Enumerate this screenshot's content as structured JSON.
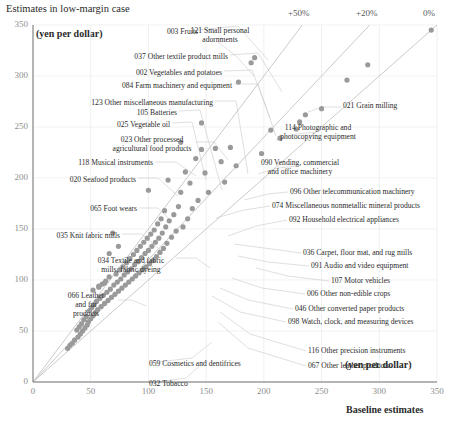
{
  "chart_data": {
    "type": "scatter",
    "title": "Estimates in low-margin case",
    "xlabel": "Baseline estimates",
    "ylabel": "",
    "x_unit": "(yen per dollar)",
    "y_unit": "(yen per dollar)",
    "xlim": [
      0,
      350
    ],
    "ylim": [
      0,
      350
    ],
    "xticks": [
      0,
      50,
      100,
      150,
      200,
      250,
      300,
      350
    ],
    "yticks": [
      0,
      50,
      100,
      150,
      200,
      250,
      300,
      350
    ],
    "grid": true,
    "legend": "none",
    "point_color": "#9a9a9a",
    "reference_lines": [
      {
        "label": "0%",
        "slope": 1.0,
        "x_at_top": 350
      },
      {
        "label": "+20%",
        "slope": 1.2,
        "x_at_top": 292
      },
      {
        "label": "+50%",
        "slope": 1.5,
        "x_at_top": 233
      }
    ],
    "points": [
      {
        "x": 345,
        "y": 345
      },
      {
        "x": 290,
        "y": 311
      },
      {
        "x": 272,
        "y": 296
      },
      {
        "x": 250,
        "y": 268
      },
      {
        "x": 236,
        "y": 262
      },
      {
        "x": 231,
        "y": 255
      },
      {
        "x": 228,
        "y": 248
      },
      {
        "x": 214,
        "y": 239
      },
      {
        "x": 206,
        "y": 247
      },
      {
        "x": 198,
        "y": 224
      },
      {
        "x": 192,
        "y": 318
      },
      {
        "x": 189,
        "y": 313
      },
      {
        "x": 178,
        "y": 294
      },
      {
        "x": 176,
        "y": 212
      },
      {
        "x": 171,
        "y": 230
      },
      {
        "x": 166,
        "y": 196
      },
      {
        "x": 163,
        "y": 216
      },
      {
        "x": 158,
        "y": 229
      },
      {
        "x": 152,
        "y": 186
      },
      {
        "x": 149,
        "y": 205
      },
      {
        "x": 146,
        "y": 228
      },
      {
        "x": 143,
        "y": 178
      },
      {
        "x": 141,
        "y": 219
      },
      {
        "x": 138,
        "y": 170
      },
      {
        "x": 136,
        "y": 195
      },
      {
        "x": 134,
        "y": 160
      },
      {
        "x": 132,
        "y": 206
      },
      {
        "x": 130,
        "y": 152
      },
      {
        "x": 128,
        "y": 186
      },
      {
        "x": 126,
        "y": 172
      },
      {
        "x": 124,
        "y": 148
      },
      {
        "x": 122,
        "y": 164
      },
      {
        "x": 120,
        "y": 142
      },
      {
        "x": 118,
        "y": 158
      },
      {
        "x": 117,
        "y": 198
      },
      {
        "x": 116,
        "y": 136
      },
      {
        "x": 115,
        "y": 152
      },
      {
        "x": 114,
        "y": 168
      },
      {
        "x": 113,
        "y": 131
      },
      {
        "x": 112,
        "y": 146
      },
      {
        "x": 111,
        "y": 160
      },
      {
        "x": 110,
        "y": 127
      },
      {
        "x": 109,
        "y": 141
      },
      {
        "x": 108,
        "y": 155
      },
      {
        "x": 107,
        "y": 123
      },
      {
        "x": 106,
        "y": 137
      },
      {
        "x": 105,
        "y": 149
      },
      {
        "x": 104,
        "y": 119
      },
      {
        "x": 103,
        "y": 133
      },
      {
        "x": 102,
        "y": 145
      },
      {
        "x": 101,
        "y": 116
      },
      {
        "x": 100,
        "y": 129
      },
      {
        "x": 99,
        "y": 141
      },
      {
        "x": 98,
        "y": 113
      },
      {
        "x": 97,
        "y": 126
      },
      {
        "x": 96,
        "y": 137
      },
      {
        "x": 95,
        "y": 110
      },
      {
        "x": 94,
        "y": 122
      },
      {
        "x": 93,
        "y": 133
      },
      {
        "x": 92,
        "y": 107
      },
      {
        "x": 91,
        "y": 118
      },
      {
        "x": 90,
        "y": 129
      },
      {
        "x": 89,
        "y": 104
      },
      {
        "x": 88,
        "y": 115
      },
      {
        "x": 87,
        "y": 125
      },
      {
        "x": 86,
        "y": 101
      },
      {
        "x": 85,
        "y": 111
      },
      {
        "x": 84,
        "y": 121
      },
      {
        "x": 83,
        "y": 98
      },
      {
        "x": 82,
        "y": 108
      },
      {
        "x": 81,
        "y": 117
      },
      {
        "x": 80,
        "y": 95
      },
      {
        "x": 79,
        "y": 105
      },
      {
        "x": 78,
        "y": 113
      },
      {
        "x": 77,
        "y": 92
      },
      {
        "x": 76,
        "y": 101
      },
      {
        "x": 75,
        "y": 110
      },
      {
        "x": 74,
        "y": 89
      },
      {
        "x": 73,
        "y": 98
      },
      {
        "x": 72,
        "y": 106
      },
      {
        "x": 71,
        "y": 86
      },
      {
        "x": 70,
        "y": 95
      },
      {
        "x": 69,
        "y": 146
      },
      {
        "x": 68,
        "y": 83
      },
      {
        "x": 67,
        "y": 91
      },
      {
        "x": 66,
        "y": 103
      },
      {
        "x": 65,
        "y": 80
      },
      {
        "x": 64,
        "y": 88
      },
      {
        "x": 63,
        "y": 99
      },
      {
        "x": 62,
        "y": 77
      },
      {
        "x": 61,
        "y": 85
      },
      {
        "x": 60,
        "y": 96
      },
      {
        "x": 59,
        "y": 74
      },
      {
        "x": 58,
        "y": 82
      },
      {
        "x": 57,
        "y": 93
      },
      {
        "x": 56,
        "y": 71
      },
      {
        "x": 55,
        "y": 79
      },
      {
        "x": 54,
        "y": 68
      },
      {
        "x": 53,
        "y": 76
      },
      {
        "x": 52,
        "y": 65
      },
      {
        "x": 51,
        "y": 73
      },
      {
        "x": 50,
        "y": 62
      },
      {
        "x": 49,
        "y": 70
      },
      {
        "x": 48,
        "y": 59
      },
      {
        "x": 47,
        "y": 56
      },
      {
        "x": 46,
        "y": 64
      },
      {
        "x": 45,
        "y": 53
      },
      {
        "x": 44,
        "y": 61
      },
      {
        "x": 43,
        "y": 50
      },
      {
        "x": 42,
        "y": 57
      },
      {
        "x": 41,
        "y": 47
      },
      {
        "x": 40,
        "y": 54
      },
      {
        "x": 39,
        "y": 44
      },
      {
        "x": 38,
        "y": 51
      },
      {
        "x": 36,
        "y": 41
      },
      {
        "x": 34,
        "y": 38
      },
      {
        "x": 32,
        "y": 36
      },
      {
        "x": 30,
        "y": 33
      },
      {
        "x": 62,
        "y": 97
      },
      {
        "x": 57,
        "y": 94
      },
      {
        "x": 52,
        "y": 90
      },
      {
        "x": 66,
        "y": 126
      },
      {
        "x": 74,
        "y": 133
      },
      {
        "x": 100,
        "y": 188
      },
      {
        "x": 128,
        "y": 235
      },
      {
        "x": 146,
        "y": 254
      }
    ],
    "annotations_left": [
      {
        "code": "003",
        "label": "003 Fruits"
      },
      {
        "code": "037",
        "label": "037 Other textile product mills"
      },
      {
        "code": "002",
        "label": "002 Vegetables and potatoes"
      },
      {
        "code": "084",
        "label": "084 Farm machinery and equipment"
      },
      {
        "code": "123",
        "label": "123 Other miscellaneous manufacturing"
      },
      {
        "code": "105",
        "label": "105 Batteries"
      },
      {
        "code": "025",
        "label": "025 Vegetable oil"
      },
      {
        "code": "023",
        "label": "023 Other processed\nagricultural food products"
      },
      {
        "code": "118",
        "label": "118 Musical instruments"
      },
      {
        "code": "020",
        "label": "020 Seafood products"
      },
      {
        "code": "065",
        "label": "065 Foot wears"
      },
      {
        "code": "035",
        "label": "035 Knit fabric mills"
      },
      {
        "code": "034",
        "label": "034 Textile and fabric\nmills, fabric dyeing"
      },
      {
        "code": "066",
        "label": "066 Leather\nand fur\nproducts"
      },
      {
        "code": "059",
        "label": "059 Cosmetics and dentifrices"
      },
      {
        "code": "032",
        "label": "032 Tobacco"
      }
    ],
    "annotations_right": [
      {
        "code": "121",
        "label": "121 Small personal\nadornments"
      },
      {
        "code": "021",
        "label": "021 Grain milling"
      },
      {
        "code": "114",
        "label": "114 Photographic and\nphotocopying equipment"
      },
      {
        "code": "090",
        "label": "090 Vending, commercial\nand office machinery"
      },
      {
        "code": "096",
        "label": "096 Other telecommunication machinery"
      },
      {
        "code": "074",
        "label": "074 Miscellaneous nonmetallic mineral products"
      },
      {
        "code": "092",
        "label": "092 Household electrical appliances"
      },
      {
        "code": "036",
        "label": "036 Carpet, floor mat, and rug mills"
      },
      {
        "code": "091",
        "label": "091 Audio and video equipment"
      },
      {
        "code": "107",
        "label": "107 Motor vehicles"
      },
      {
        "code": "006",
        "label": "006 Other non-edible crops"
      },
      {
        "code": "046",
        "label": "046 Other converted paper products"
      },
      {
        "code": "098",
        "label": "098 Watch, clock, and measuring devices"
      },
      {
        "code": "116",
        "label": "116 Other precision instruments"
      },
      {
        "code": "067",
        "label": "067 Other leather products"
      }
    ]
  },
  "annotation_layout": {
    "left": [
      {
        "i": 0,
        "x": 198,
        "y": 32,
        "align": "r"
      },
      {
        "i": 1,
        "x": 228,
        "y": 57,
        "align": "r"
      },
      {
        "i": 2,
        "x": 222,
        "y": 73,
        "align": "r"
      },
      {
        "i": 3,
        "x": 232,
        "y": 86,
        "align": "r"
      },
      {
        "i": 4,
        "x": 213,
        "y": 103,
        "align": "r"
      },
      {
        "i": 5,
        "x": 177,
        "y": 113,
        "align": "r"
      },
      {
        "i": 6,
        "x": 170,
        "y": 125,
        "align": "r"
      },
      {
        "i": 7,
        "x": 152,
        "y": 140,
        "align": "c"
      },
      {
        "i": 8,
        "x": 153,
        "y": 163,
        "align": "r"
      },
      {
        "i": 9,
        "x": 136,
        "y": 180,
        "align": "r"
      },
      {
        "i": 10,
        "x": 137,
        "y": 209,
        "align": "r"
      },
      {
        "i": 11,
        "x": 120,
        "y": 236,
        "align": "r"
      },
      {
        "i": 12,
        "x": 131,
        "y": 261,
        "align": "c"
      },
      {
        "i": 13,
        "x": 86,
        "y": 296,
        "align": "c"
      },
      {
        "i": 14,
        "x": 149,
        "y": 364,
        "align": "l"
      },
      {
        "i": 15,
        "x": 149,
        "y": 384,
        "align": "l"
      }
    ],
    "right": [
      {
        "i": 0,
        "x": 220,
        "y": 31,
        "align": "c"
      },
      {
        "i": 1,
        "x": 343,
        "y": 106,
        "align": "l"
      },
      {
        "i": 2,
        "x": 318,
        "y": 128,
        "align": "c"
      },
      {
        "i": 3,
        "x": 300,
        "y": 163,
        "align": "c"
      },
      {
        "i": 4,
        "x": 290,
        "y": 192,
        "align": "l"
      },
      {
        "i": 5,
        "x": 272,
        "y": 206,
        "align": "l"
      },
      {
        "i": 6,
        "x": 289,
        "y": 220,
        "align": "l"
      },
      {
        "i": 7,
        "x": 303,
        "y": 253,
        "align": "l"
      },
      {
        "i": 8,
        "x": 311,
        "y": 266,
        "align": "l"
      },
      {
        "i": 9,
        "x": 331,
        "y": 281,
        "align": "l"
      },
      {
        "i": 10,
        "x": 307,
        "y": 294,
        "align": "l"
      },
      {
        "i": 11,
        "x": 295,
        "y": 309,
        "align": "l"
      },
      {
        "i": 12,
        "x": 288,
        "y": 322,
        "align": "l"
      },
      {
        "i": 13,
        "x": 308,
        "y": 351,
        "align": "l"
      },
      {
        "i": 14,
        "x": 308,
        "y": 366,
        "align": "l"
      }
    ]
  },
  "leader_lines_left": [
    [
      198,
      30,
      238,
      26,
      268,
      60
    ],
    [
      230,
      55,
      258,
      53,
      282,
      92
    ],
    [
      224,
      71,
      252,
      70,
      270,
      118
    ],
    [
      234,
      84,
      258,
      84,
      276,
      136
    ],
    [
      215,
      101,
      236,
      101,
      248,
      174
    ],
    [
      179,
      111,
      200,
      110,
      222,
      190
    ],
    [
      172,
      123,
      192,
      122,
      206,
      180
    ],
    [
      196,
      142,
      214,
      142,
      228,
      160
    ],
    [
      155,
      162,
      176,
      162,
      196,
      176
    ],
    [
      138,
      178,
      158,
      178,
      178,
      196
    ],
    [
      139,
      208,
      158,
      208,
      172,
      222
    ],
    [
      122,
      234,
      142,
      234,
      160,
      250
    ],
    [
      176,
      258,
      196,
      258,
      210,
      268
    ],
    [
      118,
      300,
      132,
      300,
      146,
      306
    ],
    [
      150,
      363,
      192,
      358,
      212,
      342
    ],
    [
      150,
      383,
      186,
      378,
      206,
      360
    ]
  ],
  "leader_lines_right": [
    [
      218,
      42,
      236,
      56,
      254,
      76
    ],
    [
      341,
      107,
      322,
      107,
      308,
      112
    ],
    [
      316,
      132,
      296,
      134,
      276,
      140
    ],
    [
      298,
      166,
      278,
      168,
      258,
      174
    ],
    [
      288,
      192,
      268,
      194,
      244,
      200
    ],
    [
      270,
      206,
      244,
      210,
      216,
      218
    ],
    [
      287,
      220,
      256,
      226,
      228,
      236
    ],
    [
      301,
      253,
      264,
      248,
      234,
      244
    ],
    [
      309,
      266,
      268,
      262,
      238,
      256
    ],
    [
      329,
      281,
      288,
      276,
      256,
      268
    ],
    [
      305,
      294,
      262,
      288,
      232,
      278
    ],
    [
      293,
      309,
      248,
      300,
      220,
      288
    ],
    [
      286,
      322,
      240,
      312,
      212,
      296
    ],
    [
      306,
      351,
      250,
      334,
      220,
      312
    ],
    [
      306,
      366,
      248,
      348,
      218,
      322
    ]
  ]
}
